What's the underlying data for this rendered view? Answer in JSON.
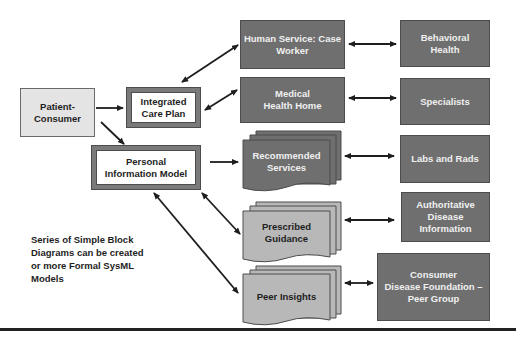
{
  "diagram": {
    "nodes": {
      "patient_consumer": "Patient-\nConsumer",
      "integrated_care_plan": "Integrated\nCare Plan",
      "personal_information_model": "Personal\nInformation Model",
      "human_service": "Human Service: Case\nWorker",
      "medical_health_home": "Medical\nHealth Home",
      "recommended_services": "Recommended\nServices",
      "prescribed_guidance": "Prescribed\nGuidance",
      "peer_insights": "Peer Insights",
      "behavioral_health": "Behavioral\nHealth",
      "specialists": "Specialists",
      "labs_and_rads": "Labs and Rads",
      "authoritative_disease_information": "Authoritative\nDisease\nInformation",
      "consumer_disease_foundation": "Consumer\nDisease Foundation –\nPeer Group"
    },
    "note": "Series of Simple Block\nDiagrams can be created\nor more Formal SysML\nModels",
    "colors": {
      "dark_fill": "#6f6f6f",
      "light_fill": "#e4e4e4",
      "doc_light_fill": "#b8b8b8",
      "border": "#4c4c4c",
      "arrow": "#1e1e1e"
    },
    "edges": [
      {
        "from": "patient_consumer",
        "to": "integrated_care_plan",
        "type": "directed"
      },
      {
        "from": "patient_consumer",
        "to": "personal_information_model",
        "type": "directed"
      },
      {
        "from": "integrated_care_plan",
        "to": "human_service",
        "type": "bidirectional"
      },
      {
        "from": "integrated_care_plan",
        "to": "medical_health_home",
        "type": "bidirectional"
      },
      {
        "from": "personal_information_model",
        "to": "recommended_services",
        "type": "directed"
      },
      {
        "from": "personal_information_model",
        "to": "prescribed_guidance",
        "type": "bidirectional"
      },
      {
        "from": "personal_information_model",
        "to": "peer_insights",
        "type": "bidirectional"
      },
      {
        "from": "human_service",
        "to": "behavioral_health",
        "type": "bidirectional"
      },
      {
        "from": "medical_health_home",
        "to": "specialists",
        "type": "bidirectional"
      },
      {
        "from": "recommended_services",
        "to": "labs_and_rads",
        "type": "bidirectional"
      },
      {
        "from": "prescribed_guidance",
        "to": "authoritative_disease_information",
        "type": "bidirectional"
      },
      {
        "from": "peer_insights",
        "to": "consumer_disease_foundation",
        "type": "bidirectional"
      }
    ]
  }
}
